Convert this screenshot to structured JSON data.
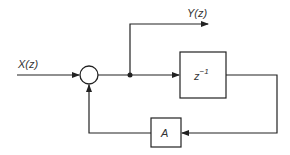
{
  "diagram": {
    "type": "block-diagram",
    "input_label": "X(z)",
    "output_label": "Y(z)",
    "delay_block": {
      "label_base": "z",
      "label_exp": "−1"
    },
    "gain_block": {
      "label": "A"
    },
    "summing_junction": {
      "symbol": "circle"
    },
    "colors": {
      "line": "#222222",
      "text": "#333333",
      "background": "#ffffff"
    }
  }
}
